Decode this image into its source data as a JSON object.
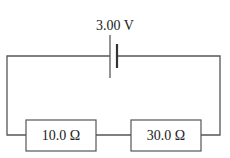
{
  "diagram": {
    "type": "series-circuit",
    "battery": {
      "label": "3.00 V",
      "voltage": "3.00 V"
    },
    "resistors": [
      {
        "label": "10.0 Ω",
        "resistance": "10.0 Ω"
      },
      {
        "label": "30.0 Ω",
        "resistance": "30.0 Ω"
      }
    ],
    "colors": {
      "wire": "#555555",
      "text": "#222222",
      "background": "#ffffff"
    }
  }
}
